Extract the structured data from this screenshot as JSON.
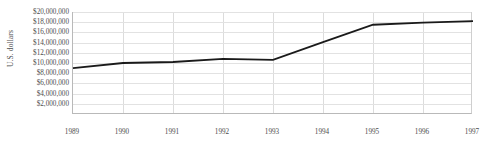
{
  "chart_data": {
    "type": "line",
    "title": "",
    "subtitle": "",
    "xlabel": "",
    "ylabel": "U.S. dollars",
    "categories": [
      "1989",
      "1990",
      "1991",
      "1992",
      "1993",
      "1994",
      "1995",
      "1996",
      "1997"
    ],
    "x": [
      1989,
      1990,
      1991,
      1992,
      1993,
      1994,
      1995,
      1996,
      1997
    ],
    "values": [
      9000000,
      10000000,
      10200000,
      10800000,
      10600000,
      14100000,
      17500000,
      17900000,
      18200000
    ],
    "series": [
      {
        "name": "U.S. dollars",
        "values": [
          9000000,
          10000000,
          10200000,
          10800000,
          10600000,
          14100000,
          17500000,
          17900000,
          18200000
        ],
        "color": "#1a1a1a"
      }
    ],
    "xlim": [
      1989,
      1997
    ],
    "ylim": [
      0,
      20000000
    ],
    "ytick_values": [
      2000000,
      4000000,
      6000000,
      8000000,
      10000000,
      12000000,
      14000000,
      16000000,
      18000000,
      20000000
    ],
    "ytick_labels": [
      "$2,000,000",
      "$4,000,000",
      "$6,000,000",
      "$8,000,000",
      "$10,000,000",
      "$12,000,000",
      "$14,000,000",
      "$16,000,000",
      "$18,000,000",
      "$20,000,000"
    ],
    "xtick_labels": [
      "1989",
      "1990",
      "1991",
      "1992",
      "1993",
      "1994",
      "1995",
      "1996",
      "1997"
    ],
    "grid": {
      "horizontal": true,
      "vertical": true
    },
    "legend": {
      "visible": false,
      "position": "none"
    },
    "annotations": [],
    "colors": {
      "line": "#1a1a1a",
      "grid": "#e2e2e2",
      "axis": "#b9b9b9",
      "text": "#4d4d4d",
      "background": "#ffffff"
    }
  }
}
